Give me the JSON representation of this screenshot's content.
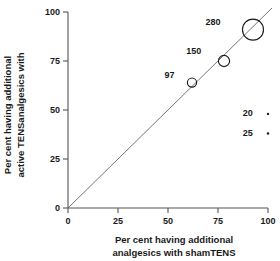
{
  "chart_data": {
    "type": "scatter",
    "title": "",
    "xlabel": "Per cent having additional analgesics with shamTENS",
    "ylabel": "Per cent having additional analgesics with active TENS",
    "xlabel_lines": [
      "Per cent having additional",
      "analgesics with shamTENS"
    ],
    "ylabel_lines": [
      "Per cent having additional",
      "active TENSanalgesics with"
    ],
    "xlim": [
      0,
      100
    ],
    "ylim": [
      0,
      100
    ],
    "xticks": [
      "0",
      "25",
      "50",
      "75",
      "100"
    ],
    "yticks": [
      "0",
      "25",
      "50",
      "75",
      "100"
    ],
    "xtick_values": [
      0,
      25,
      50,
      75,
      100
    ],
    "ytick_values": [
      0,
      25,
      50,
      75,
      100
    ],
    "grid": false,
    "legend": "none",
    "reference_line": {
      "name": "line-of-equality",
      "from": [
        0,
        0
      ],
      "to": [
        100,
        100
      ]
    },
    "points": [
      {
        "label": "97",
        "x": 62,
        "y": 64,
        "weight": 97,
        "marker": "open-circle",
        "radius_px": 4.6,
        "label_dx": -13,
        "label_dy": -5
      },
      {
        "label": "150",
        "x": 78,
        "y": 75,
        "weight": 150,
        "marker": "open-circle",
        "radius_px": 5.6,
        "label_dx": -17,
        "label_dy": -7
      },
      {
        "label": "280",
        "x": 92.5,
        "y": 91,
        "weight": 280,
        "marker": "open-circle",
        "radius_px": 10.5,
        "label_dx": -22,
        "label_dy": -5
      },
      {
        "label": "20",
        "x": 100,
        "y": 48,
        "weight": 20,
        "marker": "filled-dot",
        "radius_px": 1.2,
        "label_dx": -14,
        "label_dy": 2
      },
      {
        "label": "25",
        "x": 100,
        "y": 38,
        "weight": 25,
        "marker": "filled-dot",
        "radius_px": 1.2,
        "label_dx": -14,
        "label_dy": 2
      }
    ]
  },
  "colors": {
    "axis": "#555555",
    "marker": "#1a1a1a",
    "reference_line": "#666666",
    "background": "#ffffff"
  },
  "xaxis": {
    "title_line1": "Per cent having additional",
    "title_line2": "analgesics with shamTENS",
    "tick_0": "0",
    "tick_1": "25",
    "tick_2": "50",
    "tick_3": "75",
    "tick_4": "100"
  },
  "yaxis": {
    "title_line1": "Per cent having additional",
    "title_line2": "active TENSanalgesics with",
    "tick_0": "0",
    "tick_1": "25",
    "tick_2": "50",
    "tick_3": "75",
    "tick_4": "100"
  },
  "point_labels": {
    "p0": "97",
    "p1": "150",
    "p2": "280",
    "p3": "20",
    "p4": "25"
  }
}
